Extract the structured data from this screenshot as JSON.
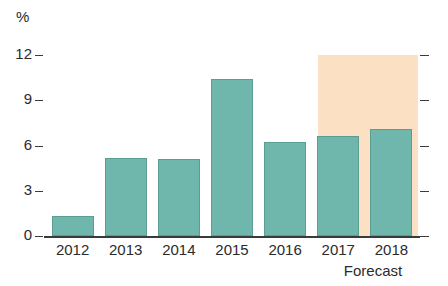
{
  "chart_data": {
    "type": "bar",
    "title": "",
    "subtitle": "",
    "xlabel": "",
    "ylabel": "%",
    "unit_label": "%",
    "categories": [
      "2012",
      "2013",
      "2014",
      "2015",
      "2016",
      "2017",
      "2018"
    ],
    "values": [
      1.3,
      5.2,
      5.1,
      10.4,
      6.2,
      6.6,
      7.1
    ],
    "series": [
      {
        "name": "Growth",
        "values": [
          1.3,
          5.2,
          5.1,
          10.4,
          6.2,
          6.6,
          7.1
        ]
      }
    ],
    "ylim": [
      0,
      12
    ],
    "yticks": [
      0,
      3,
      6,
      9,
      12
    ],
    "ytick_labels": [
      "0",
      "3",
      "6",
      "9",
      "12"
    ],
    "grid": false,
    "legend": null,
    "annotations": [
      {
        "text": "Forecast",
        "covers_categories": [
          "2017",
          "2018"
        ]
      }
    ],
    "colors": {
      "bar": "#6fb7ac",
      "bar_border": "#5b9c93",
      "forecast_band": "#fbe0c4",
      "axis": "#3a3a3a",
      "text": "#2b2b2b",
      "background": "#ffffff"
    },
    "right_axis_ticks": [
      "0",
      "3",
      "6",
      "9",
      "12"
    ]
  },
  "labels": {
    "forecast": "Forecast"
  }
}
